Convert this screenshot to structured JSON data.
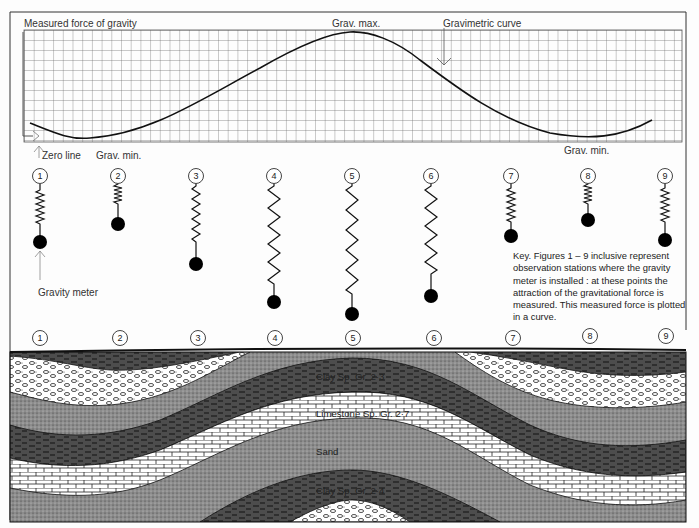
{
  "graph": {
    "ylabel": "Measured force of gravity",
    "max_label": "Grav. max.",
    "curve_label": "Gravimetric curve",
    "zero_label": "Zero line",
    "min_label_left": "Grav. min.",
    "min_label_right": "Grav. min."
  },
  "meters": {
    "pointer_label": "Gravity meter",
    "stations": [
      "1",
      "2",
      "3",
      "4",
      "5",
      "6",
      "7",
      "8",
      "9"
    ],
    "relative_extension": [
      1,
      0.55,
      1.2,
      1.95,
      2.3,
      1.85,
      1.05,
      0.6,
      1.05
    ]
  },
  "key": {
    "text": "Key. Figures 1 – 9 inclusive represent observation stations where the gravity meter is installed : at these points the attraction of the gravitational force is measured. This measured force is plotted in a curve."
  },
  "surface_stations": [
    "1",
    "2",
    "3",
    "4",
    "5",
    "6",
    "7",
    "8",
    "9"
  ],
  "strata": {
    "clay_upper": "Clay Sp. Gr. 2·3",
    "limestone": "Limestone Sp. Gr. 2·7",
    "sand": "Sand",
    "clay_lower": "Clay Sp. Gr. 2·4"
  },
  "colors": {
    "clay": "#4a4a4a",
    "sand": "#8a8a8a",
    "limestone": "#ffffff",
    "gravel": "#ffffff",
    "grid": "#555555",
    "ink": "#111111"
  }
}
